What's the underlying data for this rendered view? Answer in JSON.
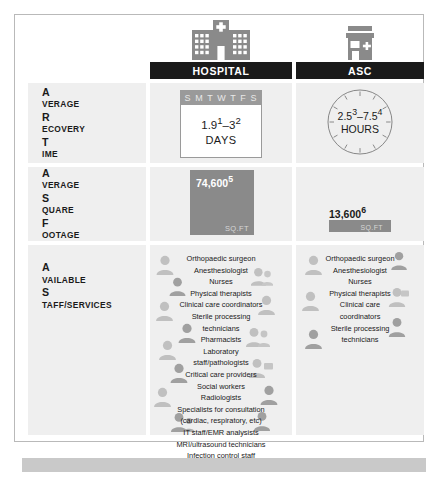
{
  "columns": [
    {
      "key": "hospital",
      "label": "HOSPITAL",
      "icon": "hospital-building-icon"
    },
    {
      "key": "asc",
      "label": "ASC",
      "icon": "clinic-building-icon"
    }
  ],
  "rows": [
    {
      "key": "recovery-time",
      "label_lines": [
        "Average",
        "Recovery",
        "Time"
      ],
      "hospital": {
        "icon": "calendar-icon",
        "calendar_header": "S M T W T F S",
        "value": "1.9",
        "sup1": "1",
        "dash": "–",
        "value2": "3",
        "sup2": "2",
        "unit": "DAYS"
      },
      "asc": {
        "icon": "clock-icon",
        "value": "2.5",
        "sup1": "3",
        "dash": "–",
        "value2": "7.5",
        "sup2": "4",
        "unit": "HOURS"
      }
    },
    {
      "key": "square-footage",
      "label_lines": [
        "Average",
        "Square",
        "Footage"
      ],
      "hospital": {
        "value": "74,600",
        "sup": "5",
        "unit": "SQ.FT"
      },
      "asc": {
        "value": "13,600",
        "sup": "6",
        "unit": "SQ.FT"
      }
    },
    {
      "key": "available-staff-services",
      "label_lines": [
        "Available",
        "Staff/Services"
      ],
      "hospital": {
        "items": [
          "Orthopaedic surgeon",
          "Anesthesiologist",
          "Nurses",
          "Physical therapists",
          "Clinical care coordinators",
          "Sterile processing",
          "technicians",
          "Pharmacists",
          "Laboratory",
          "staff/pathologists",
          "Critical care providers",
          "Social workers",
          "Radiologists",
          "Specialists for consultation",
          "(cardiac, respiratory, etc)",
          "IT staff/EMR analysists",
          "MRI/ultrasound technicians",
          "Infection control staff"
        ]
      },
      "asc": {
        "items": [
          "Orthopaedic surgeon",
          "Anesthesiologist",
          "Nurses",
          "Physical therapists",
          "Clinical care",
          "coordinators",
          "Sterile processing",
          "technicians"
        ]
      }
    }
  ],
  "colors": {
    "header_bar": "#1a1a1a",
    "cell_background": "#efefef",
    "bar_fill": "#8a8a8a",
    "icon_grey": "#8a8a8a",
    "frame_border": "#b9b9b9",
    "bottom_band": "#c9c9c9"
  }
}
